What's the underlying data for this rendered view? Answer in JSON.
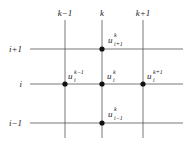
{
  "columns": [
    {
      "label": "k−1",
      "x": 65
    },
    {
      "label": "k",
      "x": 102
    },
    {
      "label": "k+1",
      "x": 143
    }
  ],
  "rows": [
    {
      "label": "i+1",
      "y": 49
    },
    {
      "label": "i",
      "y": 84
    },
    {
      "label": "i−1",
      "y": 123
    }
  ],
  "nodes": [
    {
      "base": "u",
      "sup": "k",
      "sub": "i+1",
      "x": 102,
      "y": 49
    },
    {
      "base": "u",
      "sup": "k−1",
      "sub": "i",
      "x": 65,
      "y": 84
    },
    {
      "base": "u",
      "sup": "k",
      "sub": "i",
      "x": 102,
      "y": 84
    },
    {
      "base": "u",
      "sup": "k+1",
      "sub": "i",
      "x": 143,
      "y": 84
    },
    {
      "base": "u",
      "sup": "k",
      "sub": "i−1",
      "x": 102,
      "y": 123
    }
  ],
  "colors": {
    "line": "#555555",
    "node": "#111111"
  }
}
